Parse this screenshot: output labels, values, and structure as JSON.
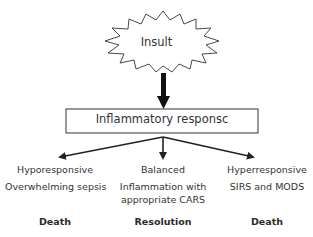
{
  "diagram": {
    "insult": {
      "label": "Insult"
    },
    "response_box": {
      "label": "Inflammatory responsc"
    },
    "branches": [
      {
        "type": "Hyporesponsive",
        "description": "Overwhelming sepsis",
        "outcome": "Death"
      },
      {
        "type": "Balanced",
        "description": "Inflammation with appropriate CARS",
        "description_lines": [
          "Inflammation with",
          "appropriate CARS"
        ],
        "outcome": "Resolution"
      },
      {
        "type": "Hyperresponsive",
        "description": "SIRS and MODS",
        "outcome": "Death"
      }
    ],
    "colors": {
      "stroke": "#222222",
      "text": "#333333",
      "background": "#ffffff"
    }
  }
}
